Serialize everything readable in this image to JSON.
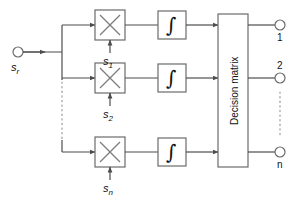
{
  "diagram": {
    "input": {
      "node_label_base": "s",
      "node_label_sub": "r",
      "node_name": "received-signal-input"
    },
    "branches": [
      {
        "index": 1,
        "multiplier_symbol": "×",
        "reference_base": "s",
        "reference_sub": "1",
        "integrator_symbol": "∫"
      },
      {
        "index": 2,
        "multiplier_symbol": "×",
        "reference_base": "s",
        "reference_sub": "2",
        "integrator_symbol": "∫"
      },
      {
        "index": 3,
        "multiplier_symbol": "×",
        "reference_base": "s",
        "reference_sub": "n",
        "integrator_symbol": "∫"
      }
    ],
    "decision_block": {
      "label": "Decision matrix"
    },
    "outputs": [
      {
        "label": "1"
      },
      {
        "label": "2"
      },
      {
        "label": "n"
      }
    ],
    "colors": {
      "line": "#4d4d4d",
      "box_stroke": "#6b6b6b",
      "text": "#111111",
      "background": "#ffffff"
    }
  }
}
